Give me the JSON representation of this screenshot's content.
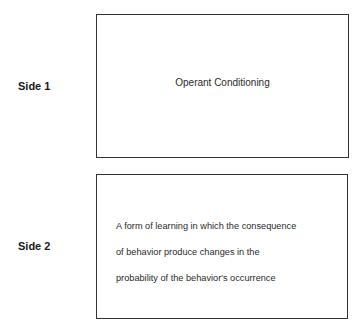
{
  "flashcard": {
    "side1": {
      "label": "Side 1",
      "text": "Operant Conditioning"
    },
    "side2": {
      "label": "Side 2",
      "lines": [
        "A form of learning in which the consequence",
        "of behavior produce changes in the",
        "probability of the behavior's occurrence"
      ]
    }
  }
}
